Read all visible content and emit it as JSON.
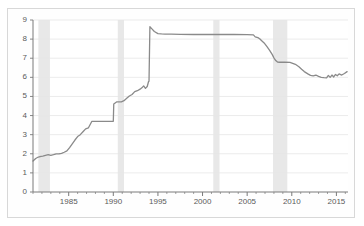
{
  "chart_data": {
    "type": "line",
    "title": "",
    "subtitle": "",
    "xlabel": "",
    "ylabel": "",
    "xlim": [
      1981.0,
      2016.3
    ],
    "ylim": [
      0,
      9
    ],
    "grid": true,
    "grid_axis": "y",
    "legend": "none",
    "line_color": "#8a8a8a",
    "grid_color": "#e6e6e6",
    "axis_color": "#7a7a7a",
    "band_color": "#e8e8e8",
    "background": "#ffffff",
    "frame_color": "#d8d8d8",
    "y_ticks": [
      0,
      1,
      2,
      3,
      4,
      5,
      6,
      7,
      8,
      9
    ],
    "y_tick_labels": [
      "0",
      "1",
      "2",
      "3",
      "4",
      "5",
      "6",
      "7",
      "8",
      "9"
    ],
    "x_ticks": [
      1985,
      1990,
      1995,
      2000,
      2005,
      2010,
      2015
    ],
    "x_tick_labels": [
      "1985",
      "1990",
      "1995",
      "2000",
      "2005",
      "2010",
      "2015"
    ],
    "x_minor_ticks": [
      1981,
      1982,
      1983,
      1984,
      1986,
      1987,
      1988,
      1989,
      1991,
      1992,
      1993,
      1994,
      1996,
      1997,
      1998,
      1999,
      2001,
      2002,
      2003,
      2004,
      2006,
      2007,
      2008,
      2009,
      2011,
      2012,
      2013,
      2014,
      2016
    ],
    "shaded_bands": [
      {
        "name": "recession-band-1",
        "x0": 1981.6,
        "x1": 1982.9
      },
      {
        "name": "recession-band-2",
        "x0": 1990.5,
        "x1": 1991.2
      },
      {
        "name": "recession-band-3",
        "x0": 2001.2,
        "x1": 2001.9
      },
      {
        "name": "recession-band-4",
        "x0": 2007.9,
        "x1": 2009.5
      }
    ],
    "series": [
      {
        "name": "value",
        "color": "#8a8a8a",
        "x": [
          1981.0,
          1981.3,
          1981.6,
          1981.9,
          1982.1,
          1982.4,
          1982.7,
          1983.0,
          1983.3,
          1983.6,
          1983.9,
          1984.2,
          1984.5,
          1984.8,
          1985.1,
          1985.4,
          1985.7,
          1986.0,
          1986.3,
          1986.6,
          1986.9,
          1987.2,
          1987.6,
          1988.0,
          1988.5,
          1989.0,
          1989.5,
          1990.0,
          1990.05,
          1990.4,
          1990.9,
          1991.2,
          1991.5,
          1991.8,
          1992.1,
          1992.4,
          1992.7,
          1993.0,
          1993.2,
          1993.4,
          1993.6,
          1993.8,
          1993.95,
          1994.0,
          1994.1,
          1994.3,
          1994.6,
          1995.0,
          1995.4,
          1995.8,
          1996.5,
          1997.5,
          1999.0,
          2000.5,
          2002.0,
          2003.5,
          2005.0,
          2005.7,
          2005.9,
          2006.2,
          2006.4,
          2006.6,
          2006.9,
          2007.2,
          2007.5,
          2007.8,
          2008.0,
          2008.2,
          2008.4,
          2008.6,
          2009.2,
          2009.8,
          2010.4,
          2010.8,
          2011.1,
          2011.4,
          2011.8,
          2012.1,
          2012.4,
          2012.7,
          2013.0,
          2013.3,
          2013.6,
          2013.9,
          2014.1,
          2014.3,
          2014.5,
          2014.7,
          2014.9,
          2015.1,
          2015.3,
          2015.6,
          2015.9,
          2016.2
        ],
        "y": [
          1.62,
          1.75,
          1.83,
          1.86,
          1.88,
          1.92,
          1.95,
          1.92,
          1.95,
          2.0,
          1.99,
          2.02,
          2.08,
          2.15,
          2.32,
          2.52,
          2.72,
          2.9,
          3.0,
          3.15,
          3.3,
          3.35,
          3.7,
          3.7,
          3.7,
          3.7,
          3.7,
          3.7,
          4.6,
          4.72,
          4.72,
          4.78,
          4.9,
          5.02,
          5.1,
          5.25,
          5.3,
          5.38,
          5.45,
          5.55,
          5.42,
          5.52,
          5.78,
          5.8,
          8.65,
          8.55,
          8.4,
          8.29,
          8.27,
          8.26,
          8.26,
          8.25,
          8.24,
          8.24,
          8.24,
          8.24,
          8.23,
          8.22,
          8.12,
          8.08,
          8.02,
          7.93,
          7.8,
          7.62,
          7.42,
          7.2,
          7.02,
          6.88,
          6.8,
          6.79,
          6.79,
          6.78,
          6.68,
          6.55,
          6.42,
          6.3,
          6.18,
          6.1,
          6.08,
          6.12,
          6.05,
          6.0,
          5.98,
          5.97,
          6.1,
          6.0,
          6.12,
          6.02,
          6.15,
          6.08,
          6.18,
          6.12,
          6.2,
          6.3
        ]
      }
    ]
  }
}
